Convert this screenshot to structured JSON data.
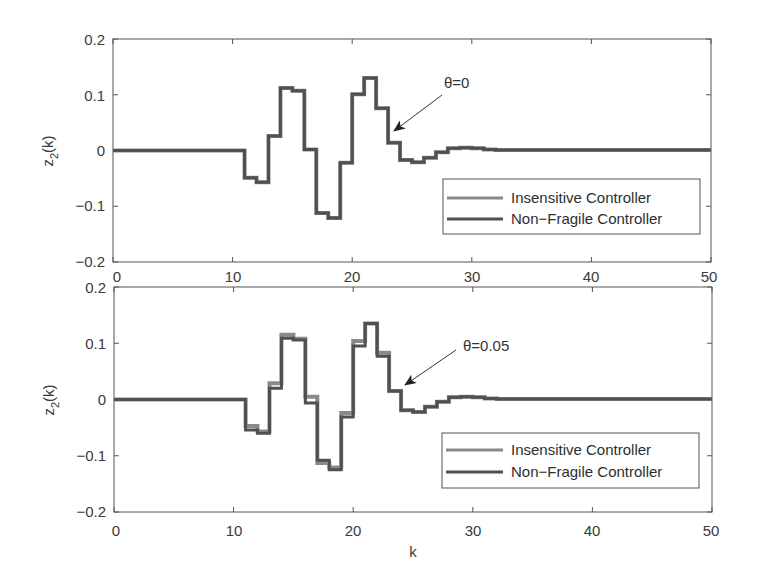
{
  "chart_data": [
    {
      "type": "line",
      "step": true,
      "panel": "top",
      "title": "",
      "xlabel": "",
      "ylabel": "z2(k)",
      "xlim": [
        0,
        50
      ],
      "ylim": [
        -0.2,
        0.2
      ],
      "xticks": [
        0,
        10,
        20,
        30,
        40,
        50
      ],
      "yticks": [
        -0.2,
        -0.1,
        0,
        0.1,
        0.2
      ],
      "xtick_labels": [
        "0",
        "10",
        "20",
        "30",
        "40",
        "50"
      ],
      "ytick_labels": [
        "-0.2",
        "-0.1",
        "0",
        "0.1",
        "0.2"
      ],
      "grid": false,
      "legend_position": "lower right",
      "annotation": {
        "text": "θ=0",
        "arrow_to": [
          23,
          0.03
        ]
      },
      "x": [
        0,
        1,
        2,
        3,
        4,
        5,
        6,
        7,
        8,
        9,
        10,
        11,
        12,
        13,
        14,
        15,
        16,
        17,
        18,
        19,
        20,
        21,
        22,
        23,
        24,
        25,
        26,
        27,
        28,
        29,
        30,
        31,
        32,
        33,
        34,
        35,
        36,
        37,
        38,
        39,
        40,
        41,
        42,
        43,
        44,
        45,
        46,
        47,
        48,
        49,
        50
      ],
      "series": [
        {
          "name": "Insensitive Controller",
          "color": "#8a8a8a",
          "values": [
            0,
            0,
            0,
            0,
            0,
            0,
            0,
            0,
            0,
            0,
            0,
            -0.049,
            -0.057,
            0.026,
            0.112,
            0.107,
            0.002,
            -0.112,
            -0.121,
            -0.022,
            0.101,
            0.13,
            0.076,
            0.014,
            -0.017,
            -0.021,
            -0.013,
            -0.003,
            0.004,
            0.005,
            0.004,
            0.002,
            0.001,
            0.001,
            0.001,
            0.001,
            0.001,
            0.001,
            0.001,
            0.001,
            0.001,
            0.001,
            0.001,
            0.001,
            0.001,
            0.001,
            0.001,
            0.001,
            0.001,
            0.001,
            0.001
          ]
        },
        {
          "name": "Non-Fragile Controller",
          "color": "#505050",
          "values": [
            0,
            0,
            0,
            0,
            0,
            0,
            0,
            0,
            0,
            0,
            0,
            -0.049,
            -0.057,
            0.026,
            0.112,
            0.107,
            0.002,
            -0.112,
            -0.121,
            -0.022,
            0.101,
            0.13,
            0.076,
            0.014,
            -0.017,
            -0.021,
            -0.013,
            -0.003,
            0.004,
            0.005,
            0.004,
            0.002,
            0.001,
            0.001,
            0.001,
            0.001,
            0.001,
            0.001,
            0.001,
            0.001,
            0.001,
            0.001,
            0.001,
            0.001,
            0.001,
            0.001,
            0.001,
            0.001,
            0.001,
            0.001,
            0.001
          ]
        }
      ]
    },
    {
      "type": "line",
      "step": true,
      "panel": "bottom",
      "title": "",
      "xlabel": "k",
      "ylabel": "z2(k)",
      "xlim": [
        0,
        50
      ],
      "ylim": [
        -0.2,
        0.2
      ],
      "xticks": [
        0,
        10,
        20,
        30,
        40,
        50
      ],
      "yticks": [
        -0.2,
        -0.1,
        0,
        0.1,
        0.2
      ],
      "xtick_labels": [
        "0",
        "10",
        "20",
        "30",
        "40",
        "50"
      ],
      "ytick_labels": [
        "-0.2",
        "-0.1",
        "0",
        "0.1",
        "0.2"
      ],
      "grid": false,
      "legend_position": "lower right",
      "annotation": {
        "text": "θ=0.05",
        "arrow_to": [
          24,
          0.025
        ]
      },
      "x": [
        0,
        1,
        2,
        3,
        4,
        5,
        6,
        7,
        8,
        9,
        10,
        11,
        12,
        13,
        14,
        15,
        16,
        17,
        18,
        19,
        20,
        21,
        22,
        23,
        24,
        25,
        26,
        27,
        28,
        29,
        30,
        31,
        32,
        33,
        34,
        35,
        36,
        37,
        38,
        39,
        40,
        41,
        42,
        43,
        44,
        45,
        46,
        47,
        48,
        49,
        50
      ],
      "series": [
        {
          "name": "Insensitive Controller",
          "color": "#8a8a8a",
          "values": [
            0,
            0,
            0,
            0,
            0,
            0,
            0,
            0,
            0,
            0,
            0,
            -0.047,
            -0.057,
            0.029,
            0.115,
            0.108,
            0.005,
            -0.113,
            -0.121,
            -0.024,
            0.104,
            0.135,
            0.083,
            0.015,
            -0.019,
            -0.022,
            -0.013,
            -0.004,
            0.004,
            0.005,
            0.004,
            0.002,
            0.001,
            0.001,
            0.001,
            0.001,
            0.001,
            0.001,
            0.001,
            0.001,
            0.001,
            0.001,
            0.001,
            0.001,
            0.001,
            0.001,
            0.001,
            0.001,
            0.001,
            0.001,
            0.001
          ]
        },
        {
          "name": "Non-Fragile Controller",
          "color": "#505050",
          "values": [
            0,
            0,
            0,
            0,
            0,
            0,
            0,
            0,
            0,
            0,
            0,
            -0.054,
            -0.06,
            0.02,
            0.109,
            0.106,
            -0.006,
            -0.108,
            -0.125,
            -0.031,
            0.095,
            0.135,
            0.077,
            0.015,
            -0.019,
            -0.022,
            -0.013,
            -0.004,
            0.004,
            0.005,
            0.004,
            0.002,
            0.001,
            0.001,
            0.001,
            0.001,
            0.001,
            0.001,
            0.001,
            0.001,
            0.001,
            0.001,
            0.001,
            0.001,
            0.001,
            0.001,
            0.001,
            0.001,
            0.001,
            0.001,
            0.001
          ]
        }
      ]
    }
  ],
  "panels": {
    "top": {
      "ylabel_main": "z",
      "ylabel_sub": "2",
      "ylabel_rest": "(k)",
      "annotation_text": "θ=0",
      "legend": [
        "Insensitive Controller",
        "Non−Fragile Controller"
      ],
      "xtick_labels": [
        "0",
        "10",
        "20",
        "30",
        "40",
        "50"
      ],
      "ytick_labels": [
        "0.2",
        "0.1",
        "0",
        "−0.1",
        "−0.2"
      ]
    },
    "bottom": {
      "ylabel_main": "z",
      "ylabel_sub": "2",
      "ylabel_rest": "(k)",
      "annotation_text": "θ=0.05",
      "legend": [
        "Insensitive Controller",
        "Non−Fragile Controller"
      ],
      "xtick_labels": [
        "0",
        "10",
        "20",
        "30",
        "40",
        "50"
      ],
      "ytick_labels": [
        "0.2",
        "0.1",
        "0",
        "−0.1",
        "−0.2"
      ],
      "xlabel": "k"
    }
  }
}
